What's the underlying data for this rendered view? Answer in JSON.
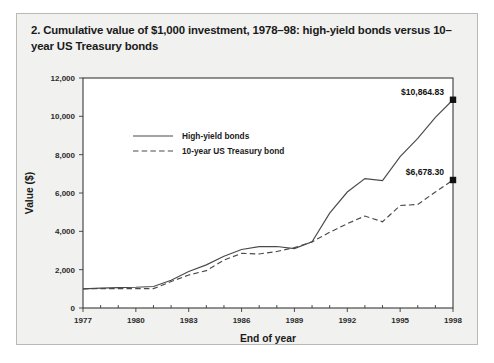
{
  "title": "2. Cumulative value of $1,000 investment, 1978–98: high-yield bonds versus 10–year US Treasury bonds",
  "chart_data": {
    "type": "line",
    "title": "2. Cumulative value of $1,000 investment, 1978–98: high-yield bonds versus 10–year US Treasury bonds",
    "xlabel": "End of year",
    "ylabel": "Value ($)",
    "xlim": [
      1977,
      1998
    ],
    "ylim": [
      0,
      12000
    ],
    "yticks": [
      0,
      2000,
      4000,
      6000,
      8000,
      10000,
      12000
    ],
    "ytick_labels": [
      "0",
      "2,000",
      "4,000",
      "6,000",
      "8,000",
      "10,000",
      "12,000"
    ],
    "xticks": [
      1977,
      1980,
      1983,
      1986,
      1989,
      1992,
      1995,
      1998
    ],
    "xtick_labels": [
      "1977",
      "1980",
      "1983",
      "1986",
      "1989",
      "1992",
      "1995",
      "1998"
    ],
    "x_minor_ticks": [
      1978,
      1979,
      1981,
      1982,
      1984,
      1985,
      1987,
      1988,
      1990,
      1991,
      1993,
      1994,
      1996,
      1997
    ],
    "grid": false,
    "legend_position": "upper-left-inside",
    "x": [
      1977,
      1978,
      1979,
      1980,
      1981,
      1982,
      1983,
      1984,
      1985,
      1986,
      1987,
      1988,
      1989,
      1990,
      1991,
      1992,
      1993,
      1994,
      1995,
      1996,
      1997,
      1998
    ],
    "series": [
      {
        "name": "High-yield bonds",
        "style": "solid",
        "values": [
          1000,
          1040,
          1060,
          1080,
          1120,
          1450,
          1900,
          2250,
          2700,
          3050,
          3200,
          3210,
          3100,
          3450,
          4950,
          6050,
          6750,
          6650,
          7900,
          8850,
          9950,
          10864.83
        ],
        "end_label": "$10,864.83",
        "end_value": 10864.83
      },
      {
        "name": "10-year US Treasury bond",
        "style": "dashed",
        "values": [
          1000,
          1010,
          1010,
          1010,
          1010,
          1380,
          1720,
          1950,
          2500,
          2850,
          2820,
          2950,
          3150,
          3450,
          3950,
          4400,
          4800,
          4500,
          5350,
          5400,
          6050,
          6678.3
        ],
        "end_label": "$6,678.30",
        "end_value": 6678.3
      }
    ],
    "annotations": [
      {
        "text": "$10,864.83",
        "x": 1998,
        "y": 10864.83
      },
      {
        "text": "$6,678.30",
        "x": 1998,
        "y": 6678.3
      }
    ],
    "colors": {
      "line": "#4a4a4a",
      "marker": "#111111",
      "axis": "#3a3a3a",
      "plot_bg": "#ffffff",
      "card_bg": "#f1f1ef"
    }
  }
}
